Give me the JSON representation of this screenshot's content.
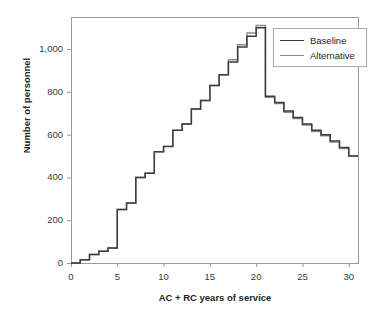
{
  "chart_data": {
    "type": "line",
    "title": "",
    "xlabel": "AC + RC years of service",
    "ylabel": "Number of personnel",
    "xlim": [
      0,
      31
    ],
    "ylim": [
      0,
      1150
    ],
    "xticks": [
      0,
      5,
      10,
      15,
      20,
      25,
      30
    ],
    "xticklabels": [
      "0",
      "5",
      "10",
      "15",
      "20",
      "25",
      "30"
    ],
    "yticks": [
      0,
      200,
      400,
      600,
      800,
      1000
    ],
    "yticklabels": [
      "0",
      "200",
      "400",
      "600",
      "800",
      "1,000"
    ],
    "grid": false,
    "drawstyle": "steps-post",
    "legend_position": "upper right",
    "x": [
      1,
      2,
      3,
      4,
      5,
      6,
      7,
      8,
      9,
      10,
      11,
      12,
      13,
      14,
      15,
      16,
      17,
      18,
      19,
      20,
      21,
      22,
      23,
      24,
      25,
      26,
      27,
      28,
      29,
      30
    ],
    "series": [
      {
        "name": "Baseline",
        "color": "#3d3d3d",
        "values": [
          15,
          40,
          55,
          70,
          250,
          280,
          400,
          420,
          520,
          545,
          620,
          650,
          720,
          760,
          830,
          880,
          940,
          1010,
          1060,
          1100,
          780,
          750,
          710,
          680,
          650,
          620,
          600,
          570,
          540,
          500
        ]
      },
      {
        "name": "Alternative",
        "color": "#8a8a8a",
        "values": [
          15,
          40,
          55,
          70,
          250,
          280,
          400,
          420,
          520,
          545,
          620,
          650,
          720,
          760,
          830,
          880,
          950,
          1020,
          1075,
          1110,
          775,
          745,
          705,
          675,
          645,
          615,
          595,
          565,
          535,
          500
        ]
      }
    ]
  },
  "axes": {
    "frame": {
      "left": 71,
      "top": 17,
      "right": 358,
      "bottom": 263
    }
  },
  "legend": {
    "entries": [
      {
        "label": "Baseline"
      },
      {
        "label": "Alternative"
      }
    ]
  }
}
